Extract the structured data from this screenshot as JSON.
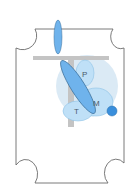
{
  "diagram": {
    "labels": {
      "p": "P",
      "m": "M",
      "t": "T"
    },
    "colors": {
      "border": "#6b6b6b",
      "background": "#ffffff",
      "bar": "#c4c4c4",
      "halo": "#dbeaf5",
      "light_blue": "#bfe0f7",
      "light_blue_stroke": "#8fc2e6",
      "mid_blue": "#6fb3ec",
      "dark_blue": "#3a8fdc",
      "outline_blue": "#3a6f9a"
    }
  }
}
